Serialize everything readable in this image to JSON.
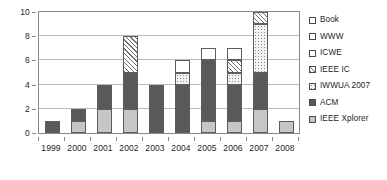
{
  "chart_data": {
    "type": "bar",
    "stacked": true,
    "title": "",
    "xlabel": "",
    "ylabel": "",
    "ylim": [
      0,
      10
    ],
    "yticks": [
      0,
      2,
      4,
      6,
      8,
      10
    ],
    "grid": true,
    "legend_position": "right",
    "categories": [
      "1999",
      "2000",
      "2001",
      "2002",
      "2003",
      "2004",
      "2005",
      "2006",
      "2007",
      "2008"
    ],
    "series": [
      {
        "name": "IEEE Xplorer",
        "pattern": "light-gray-solid",
        "values": [
          0,
          1,
          2,
          2,
          0,
          0,
          1,
          1,
          2,
          1
        ]
      },
      {
        "name": "ACM",
        "pattern": "dark-gray-solid",
        "values": [
          1,
          1,
          2,
          3,
          4,
          4,
          5,
          3,
          3,
          0
        ]
      },
      {
        "name": "IWWUA 2007",
        "pattern": "dotted",
        "values": [
          0,
          0,
          0,
          0,
          0,
          1,
          0,
          1,
          4,
          0
        ]
      },
      {
        "name": "IEEE IC",
        "pattern": "diagonal-hatch",
        "values": [
          0,
          0,
          0,
          3,
          0,
          0,
          0,
          1,
          1,
          0
        ]
      },
      {
        "name": "ICWE",
        "pattern": "white",
        "values": [
          0,
          0,
          0,
          0,
          0,
          1,
          1,
          1,
          0,
          0
        ]
      },
      {
        "name": "WWW",
        "pattern": "white",
        "values": [
          0,
          0,
          0,
          0,
          0,
          0,
          0,
          0,
          0,
          0
        ]
      },
      {
        "name": "Book",
        "pattern": "white",
        "values": [
          0,
          0,
          0,
          0,
          0,
          0,
          0,
          0,
          0,
          0
        ]
      }
    ],
    "totals": [
      1,
      2,
      4,
      8,
      4,
      6,
      7,
      6,
      10,
      1
    ]
  },
  "legend": {
    "items": [
      {
        "label": "Book",
        "key": "book"
      },
      {
        "label": "WWW",
        "key": "www"
      },
      {
        "label": "ICWE",
        "key": "icwe"
      },
      {
        "label": "IEEE IC",
        "key": "ieeeic"
      },
      {
        "label": "IWWUA 2007",
        "key": "iwwua"
      },
      {
        "label": "ACM",
        "key": "acm"
      },
      {
        "label": "IEEE Xplorer",
        "key": "xplorer"
      }
    ]
  },
  "colors": {
    "light_gray": "#c6c6c6",
    "dark_gray": "#595959",
    "white": "#ffffff",
    "axis": "#8a8a8a",
    "grid": "#b9b9b9",
    "text": "#231f20"
  }
}
